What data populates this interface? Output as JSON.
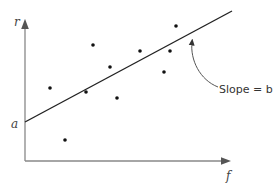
{
  "diagram": {
    "type": "scatter-with-regression-line",
    "y_axis_label": "r",
    "x_axis_label": "f",
    "intercept_label": "a",
    "slope_label": "Slope = b",
    "colors": {
      "axes": "#888888",
      "line": "#222222",
      "points": "#111111",
      "text": "#444444"
    }
  },
  "chart_data": {
    "type": "scatter",
    "title": "",
    "xlabel": "f",
    "ylabel": "r",
    "annotations": [
      "a (y-intercept)",
      "Slope = b"
    ],
    "points_px": [
      {
        "x": 50,
        "y": 88
      },
      {
        "x": 65,
        "y": 140
      },
      {
        "x": 86,
        "y": 92
      },
      {
        "x": 93,
        "y": 45
      },
      {
        "x": 110,
        "y": 67
      },
      {
        "x": 117,
        "y": 98
      },
      {
        "x": 140,
        "y": 51
      },
      {
        "x": 164,
        "y": 72
      },
      {
        "x": 170,
        "y": 51
      },
      {
        "x": 176,
        "y": 26
      }
    ],
    "regression_line_px": {
      "x1": 25,
      "y1": 122,
      "x2": 232,
      "y2": 11
    },
    "grid": false
  }
}
